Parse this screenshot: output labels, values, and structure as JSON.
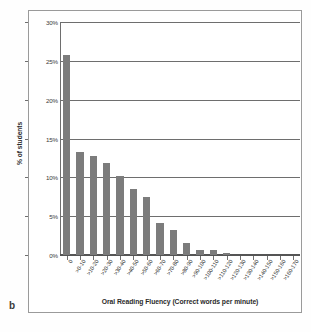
{
  "figure": {
    "panel_label": "b"
  },
  "chart_data": {
    "type": "bar",
    "title": "",
    "xlabel": "Oral Reading Fluency (Correct words per minute)",
    "ylabel": "% of students",
    "ylim": [
      0,
      30
    ],
    "ytick_labels": [
      "30%",
      "25%",
      "20%",
      "15%",
      "10%",
      "5%",
      "0%"
    ],
    "ytick_values": [
      30,
      25,
      20,
      15,
      10,
      5,
      0
    ],
    "grid": true,
    "legend": null,
    "bar_color": "#7c7c7c",
    "categories": [
      "0",
      ">0-10",
      ">10-20",
      ">20-30",
      ">30-40",
      ">40-50",
      ">50-60",
      ">60-70",
      ">70-80",
      ">80-90",
      ">90-100",
      ">100-110",
      ">110-120",
      ">120-130",
      ">130-140",
      ">140-150",
      ">150-160",
      ">160-170"
    ],
    "values": [
      25.8,
      13.3,
      12.8,
      11.9,
      10.2,
      8.5,
      7.5,
      4.1,
      3.2,
      1.5,
      0.6,
      0.6,
      0.3,
      0,
      0,
      0,
      0,
      0
    ]
  }
}
